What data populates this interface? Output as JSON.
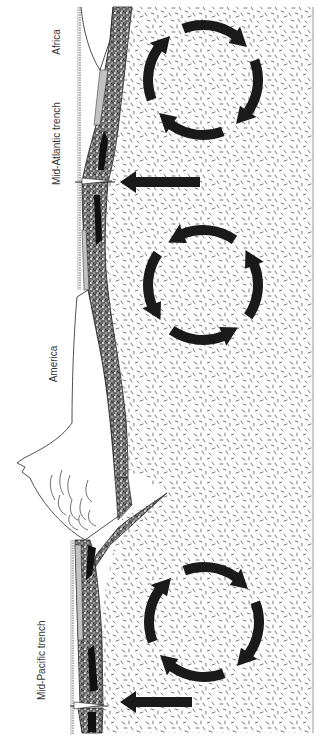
{
  "diagram": {
    "orientation": "rotated 90 degrees counter-clockwise",
    "labels": {
      "africa": "Africa",
      "mid_atlantic": "Mid-Atlantic trench",
      "america": "America",
      "mid_pacific": "Mid-Pacific trench"
    },
    "convection_cells": [
      {
        "id": "cell-1",
        "location": "beneath Africa / Mid-Atlantic",
        "arrows": 4
      },
      {
        "id": "cell-2",
        "location": "beneath Atlantic / America",
        "arrows": 4
      },
      {
        "id": "cell-3",
        "location": "beneath Pacific",
        "arrows": 4
      }
    ],
    "upwelling_arrows": [
      {
        "id": "upwelling-mid-atlantic",
        "at": "Mid-Atlantic trench"
      },
      {
        "id": "upwelling-mid-pacific",
        "at": "Mid-Pacific trench"
      }
    ],
    "colors": {
      "ink": "#1a1a1a",
      "background": "#ffffff",
      "mantle_speckle": "#555555",
      "crust": "#3a3a3a"
    }
  }
}
